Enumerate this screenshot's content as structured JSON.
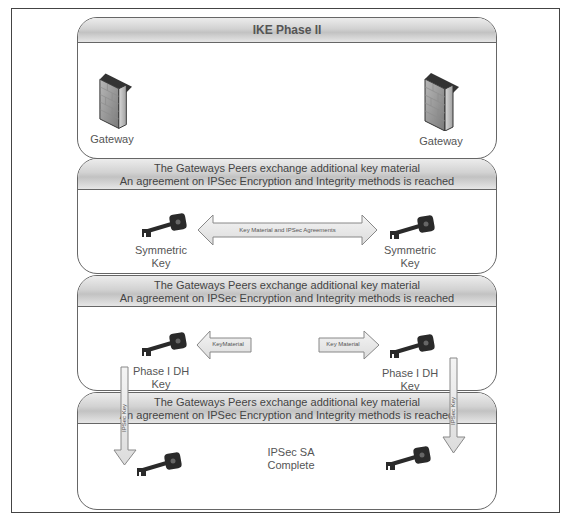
{
  "diagram": {
    "title": "IKE Phase II",
    "panel1": {
      "left_gateway": "Gateway",
      "right_gateway": "Gateway"
    },
    "panel2": {
      "header_line1": "The Gateways Peers exchange additional key material",
      "header_line2": "An agreement on IPSec Encryption and Integrity methods is reached",
      "arrow_label": "Key Material and IPSec Agreements",
      "left_key_line1": "Symmetric",
      "left_key_line2": "Key",
      "right_key_line1": "Symmetric",
      "right_key_line2": "Key"
    },
    "panel3": {
      "header_line1": "The Gateways Peers exchange additional key material",
      "header_line2": "An agreement on IPSec Encryption and Integrity methods is reached",
      "left_arrow_label": "KeyMaterial",
      "right_arrow_label": "Key Material",
      "left_key_line1": "Phase I DH",
      "left_key_line2": "Key",
      "right_key_line1": "Phase I DH",
      "right_key_line2": "Key"
    },
    "panel4": {
      "header_line1": "The Gateways Peers exchange additional key material",
      "header_line2": "An agreement on IPSec Encryption and Integrity methods is reached",
      "status_line1": "IPSec SA",
      "status_line2": "Complete"
    },
    "vertical_arrows": {
      "left_label": "IPSec Key",
      "right_label": "IPSec Key"
    },
    "colors": {
      "border": "#666666",
      "header_fill": "#d2d2d2",
      "arrow_fill": "#eaeaea",
      "key_color": "#2a2a2a",
      "firewall_color": "#9a9a9a"
    }
  }
}
